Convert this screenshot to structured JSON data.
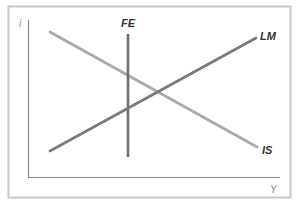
{
  "diagram": {
    "axes": {
      "y_label": "i",
      "x_label": "Y"
    },
    "curves": [
      {
        "id": "FE",
        "label": "FE",
        "shape": "vertical",
        "color": "#6e6e6e"
      },
      {
        "id": "LM",
        "label": "LM",
        "shape": "upward-sloping",
        "color": "#7a7a7a"
      },
      {
        "id": "IS",
        "label": "IS",
        "shape": "downward-sloping",
        "color": "#a8a8a8"
      }
    ],
    "colors": {
      "frame": "#c8c8c8",
      "axis": "#8a8a8a"
    }
  }
}
